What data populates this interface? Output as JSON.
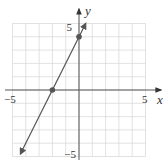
{
  "chart_data": {
    "type": "line",
    "title": "",
    "xlabel": "x",
    "ylabel": "y",
    "xlim": [
      -5,
      5
    ],
    "ylim": [
      -5,
      5
    ],
    "x_tick_labels": [
      "−5",
      "5"
    ],
    "y_tick_labels": [
      "5",
      "−5"
    ],
    "grid": true,
    "grid_step": 1,
    "series": [
      {
        "name": "line",
        "equation": "y = 2x + 4",
        "slope": 2,
        "intercept": 4,
        "arrows_both_ends": true,
        "x": [
          -4.4,
          0.5
        ],
        "y": [
          -4.8,
          5.0
        ]
      }
    ],
    "marked_points": [
      {
        "x": -2,
        "y": 0,
        "label": "x-intercept"
      },
      {
        "x": 0,
        "y": 4,
        "label": "y-intercept"
      }
    ],
    "color": "#555555"
  },
  "labels": {
    "x_axis": "x",
    "y_axis": "y",
    "x_min": "−5",
    "x_max": "5",
    "y_max": "5",
    "y_min": "−5"
  }
}
